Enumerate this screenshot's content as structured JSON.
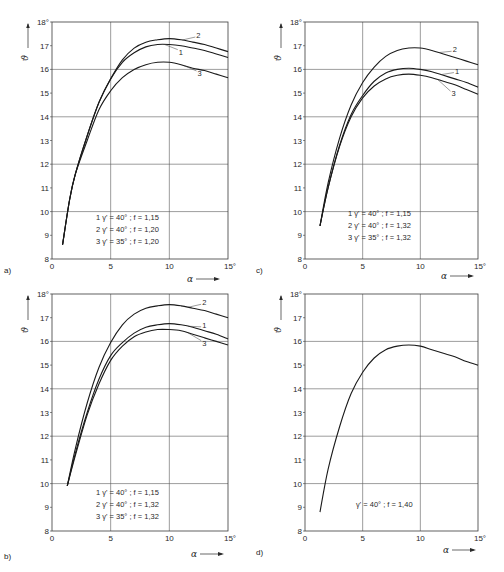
{
  "chart_data": [
    {
      "id": "a",
      "panel_label": "a)",
      "type": "line",
      "xlabel": "α",
      "ylabel": "ϑ",
      "xlim": [
        0,
        15
      ],
      "ylim": [
        8,
        18
      ],
      "x_ticks": [
        "0",
        "5",
        "10",
        "15°"
      ],
      "y_ticks": [
        "8",
        "9",
        "10",
        "11",
        "12",
        "13",
        "14",
        "15",
        "16",
        "17",
        "18°"
      ],
      "grid": true,
      "legend": [
        "1  γ' = 40° ;   f = 1,15",
        "2  γ' = 40° ;   f = 1,20",
        "3  γ' = 35° ;   f = 1,20"
      ],
      "series": [
        {
          "name": "1",
          "x": [
            0.9,
            1.5,
            2,
            3,
            4,
            5,
            6,
            7,
            8,
            9,
            10,
            11,
            12,
            13,
            14,
            15
          ],
          "values": [
            8.6,
            10.5,
            11.6,
            13.2,
            14.6,
            15.6,
            16.3,
            16.7,
            16.95,
            17.05,
            17.05,
            17.0,
            16.9,
            16.8,
            16.65,
            16.5
          ]
        },
        {
          "name": "2",
          "x": [
            0.9,
            1.5,
            2,
            3,
            4,
            5,
            6,
            7,
            8,
            9,
            10,
            11,
            12,
            13,
            14,
            15
          ],
          "values": [
            8.6,
            10.5,
            11.6,
            13.2,
            14.6,
            15.6,
            16.4,
            16.9,
            17.15,
            17.25,
            17.3,
            17.25,
            17.15,
            17.05,
            16.9,
            16.75
          ]
        },
        {
          "name": "3",
          "x": [
            0.9,
            1.5,
            2,
            3,
            4,
            5,
            6,
            7,
            8,
            9,
            10,
            11,
            12,
            13,
            14,
            15
          ],
          "values": [
            8.6,
            10.5,
            11.6,
            13.0,
            14.3,
            15.1,
            15.65,
            16.0,
            16.2,
            16.3,
            16.3,
            16.2,
            16.05,
            15.95,
            15.8,
            15.65
          ]
        }
      ],
      "labels_at": {
        "1": [
          10.8,
          16.75
        ],
        "2": [
          12.3,
          17.45
        ],
        "3": [
          12.4,
          15.85
        ]
      }
    },
    {
      "id": "c",
      "panel_label": "c)",
      "type": "line",
      "xlabel": "α",
      "ylabel": "ϑ",
      "xlim": [
        0,
        15
      ],
      "ylim": [
        8,
        18
      ],
      "x_ticks": [
        "0",
        "5",
        "10",
        "15°"
      ],
      "y_ticks": [
        "8",
        "9",
        "10",
        "11",
        "12",
        "13",
        "14",
        "15",
        "16",
        "17",
        "18°"
      ],
      "grid": true,
      "legend": [
        "1  γ' = 40° ;   f = 1,15",
        "2  γ' = 40° ;   f = 1,32",
        "3  γ' = 35° ;   f = 1,32"
      ],
      "series": [
        {
          "name": "1",
          "x": [
            1.3,
            2,
            3,
            4,
            5,
            6,
            7,
            8,
            9,
            10,
            11,
            12,
            13,
            14,
            15
          ],
          "values": [
            9.4,
            11.0,
            12.8,
            14.1,
            14.9,
            15.5,
            15.85,
            16.0,
            16.05,
            16.0,
            15.9,
            15.75,
            15.6,
            15.45,
            15.25
          ]
        },
        {
          "name": "2",
          "x": [
            1.3,
            2,
            3,
            4,
            5,
            6,
            7,
            8,
            9,
            10,
            11,
            12,
            13,
            14,
            15
          ],
          "values": [
            9.4,
            11.2,
            13.1,
            14.5,
            15.45,
            16.1,
            16.55,
            16.8,
            16.9,
            16.9,
            16.8,
            16.65,
            16.5,
            16.35,
            16.2
          ]
        },
        {
          "name": "3",
          "x": [
            1.3,
            2,
            3,
            4,
            5,
            6,
            7,
            8,
            9,
            10,
            11,
            12,
            13,
            14,
            15
          ],
          "values": [
            9.4,
            11.0,
            12.75,
            14.0,
            14.8,
            15.3,
            15.6,
            15.75,
            15.8,
            15.75,
            15.65,
            15.5,
            15.35,
            15.15,
            14.95
          ]
        }
      ],
      "labels_at": {
        "1": [
          13.0,
          15.95
        ],
        "2": [
          12.8,
          16.85
        ],
        "3": [
          12.7,
          15.0
        ]
      }
    },
    {
      "id": "b",
      "panel_label": "b)",
      "type": "line",
      "xlabel": "α",
      "ylabel": "ϑ",
      "xlim": [
        0,
        15
      ],
      "ylim": [
        8,
        18
      ],
      "x_ticks": [
        "0",
        "5",
        "10",
        "15°"
      ],
      "y_ticks": [
        "8",
        "9",
        "10",
        "11",
        "12",
        "13",
        "14",
        "15",
        "16",
        "17",
        "18°"
      ],
      "grid": true,
      "legend": [
        "1  γ' = 40° ;   f = 1,15",
        "2  γ' = 40° ;   f = 1,32",
        "3  γ' = 35° ;   f = 1,32"
      ],
      "series": [
        {
          "name": "1",
          "x": [
            1.3,
            2,
            3,
            4,
            5,
            6,
            7,
            8,
            9,
            10,
            11,
            12,
            13,
            14,
            15
          ],
          "values": [
            9.9,
            11.3,
            13.0,
            14.4,
            15.4,
            15.95,
            16.35,
            16.6,
            16.7,
            16.75,
            16.7,
            16.6,
            16.45,
            16.3,
            16.1
          ]
        },
        {
          "name": "2",
          "x": [
            1.3,
            2,
            3,
            4,
            5,
            6,
            7,
            8,
            9,
            10,
            11,
            12,
            13,
            14,
            15
          ],
          "values": [
            9.9,
            11.5,
            13.4,
            14.9,
            15.95,
            16.7,
            17.15,
            17.4,
            17.5,
            17.55,
            17.5,
            17.4,
            17.3,
            17.15,
            17.0
          ]
        },
        {
          "name": "3",
          "x": [
            1.3,
            2,
            3,
            4,
            5,
            6,
            7,
            8,
            9,
            10,
            11,
            12,
            13,
            14,
            15
          ],
          "values": [
            9.9,
            11.2,
            12.9,
            14.2,
            15.2,
            15.8,
            16.2,
            16.4,
            16.5,
            16.5,
            16.45,
            16.3,
            16.15,
            16.0,
            15.85
          ]
        }
      ],
      "labels_at": {
        "1": [
          12.8,
          16.7
        ],
        "2": [
          12.8,
          17.65
        ],
        "3": [
          12.8,
          15.95
        ]
      }
    },
    {
      "id": "d",
      "panel_label": "d)",
      "type": "line",
      "xlabel": "α",
      "ylabel": "ϑ",
      "xlim": [
        0,
        15
      ],
      "ylim": [
        8,
        18
      ],
      "x_ticks": [
        "0",
        "5",
        "10",
        "15°"
      ],
      "y_ticks": [
        "8",
        "9",
        "10",
        "11",
        "12",
        "13",
        "14",
        "15",
        "16",
        "17",
        "18°"
      ],
      "grid": true,
      "legend": [
        "γ' = 40° ;   f = 1,40"
      ],
      "series": [
        {
          "name": "γ' = 40°; f = 1,40",
          "x": [
            1.3,
            2,
            3,
            4,
            5,
            6,
            7,
            8,
            9,
            10,
            11,
            12,
            13,
            14,
            15
          ],
          "values": [
            8.8,
            10.6,
            12.4,
            13.8,
            14.7,
            15.3,
            15.65,
            15.8,
            15.85,
            15.8,
            15.65,
            15.5,
            15.35,
            15.15,
            15.0
          ]
        }
      ],
      "labels_at": {}
    }
  ]
}
